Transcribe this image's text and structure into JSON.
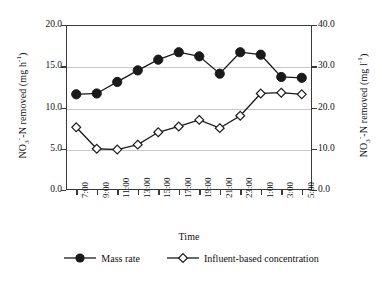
{
  "chart_data": {
    "type": "line",
    "title": "",
    "xlabel": "Time",
    "ylabel": "NO3--N removed (mg h-1)",
    "y2label": "NO3--N removed (mg l-1)",
    "categories": [
      "7:00",
      "9:00",
      "11:00",
      "13:00",
      "15:00",
      "17:00",
      "19:00",
      "21:00",
      "23:00",
      "1:00",
      "3:00",
      "5:00"
    ],
    "ylim": [
      0.0,
      20.0
    ],
    "yticks": [
      "0.0",
      "5.0",
      "10.0",
      "15.0",
      "20.0"
    ],
    "ytick_values": [
      0.0,
      5.0,
      10.0,
      15.0,
      20.0
    ],
    "y2lim": [
      0.0,
      40.0
    ],
    "y2ticks": [
      "0.0",
      "10.0",
      "20.0",
      "30.0",
      "40.0"
    ],
    "y2tick_values": [
      0.0,
      10.0,
      20.0,
      30.0,
      40.0
    ],
    "grid": "horizontal",
    "legend_position": "bottom",
    "series": [
      {
        "name": "Mass rate",
        "marker": "filled-circle",
        "axis": "left",
        "values": [
          11.6,
          11.7,
          13.1,
          14.5,
          15.8,
          16.7,
          16.2,
          14.1,
          16.7,
          16.4,
          13.7,
          13.6
        ]
      },
      {
        "name": "Influent-based concentration",
        "marker": "open-diamond",
        "axis": "left",
        "values": [
          7.6,
          5.0,
          4.9,
          5.5,
          7.0,
          7.7,
          8.5,
          7.5,
          9.0,
          11.7,
          11.8,
          11.6
        ]
      }
    ]
  },
  "axes": {
    "x_title": "Time",
    "y_left": {
      "prefix": "NO",
      "sub": "3",
      "sup_charge": "-",
      "mid": "-N removed (mg h",
      "sup_unit": "-1",
      "suffix": ")"
    },
    "y_right": {
      "prefix": "NO",
      "sub": "3",
      "sup_charge": "-",
      "mid": "-N removed (mg l",
      "sup_unit": "-1",
      "suffix": ")"
    }
  },
  "legend": {
    "entries": [
      {
        "label": "Mass rate",
        "marker": "filled-circle"
      },
      {
        "label": "Influent-based concentration",
        "marker": "open-diamond"
      }
    ]
  },
  "colors": {
    "series_stroke": "#1a1a1a",
    "marker_fill": "#1a1a1a",
    "marker_open_fill": "#ffffff",
    "gridline": "#c8c8c8",
    "frame": "#3a3a3a",
    "background": "#ffffff"
  }
}
